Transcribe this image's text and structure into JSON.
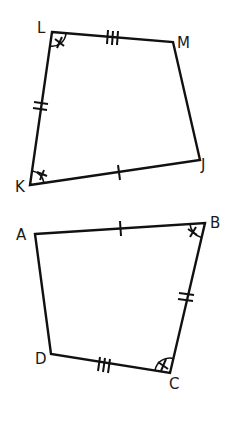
{
  "diagram": {
    "title": "",
    "figures": [
      {
        "name": "LMJK",
        "vertices": {
          "L": {
            "label": "L",
            "x": 52,
            "y": 32
          },
          "M": {
            "label": "M",
            "x": 173,
            "y": 42
          },
          "J": {
            "label": "J",
            "x": 200,
            "y": 160
          },
          "K": {
            "label": "K",
            "x": 30,
            "y": 185
          }
        },
        "sides": [
          {
            "from": "L",
            "to": "M",
            "ticks": 3
          },
          {
            "from": "M",
            "to": "J",
            "ticks": 0
          },
          {
            "from": "J",
            "to": "K",
            "ticks": 1
          },
          {
            "from": "K",
            "to": "L",
            "ticks": 2
          }
        ],
        "angle_marks": [
          "L",
          "K"
        ]
      },
      {
        "name": "ABCD",
        "vertices": {
          "A": {
            "label": "A",
            "x": 35,
            "y": 234
          },
          "B": {
            "label": "B",
            "x": 205,
            "y": 223
          },
          "C": {
            "label": "C",
            "x": 170,
            "y": 373
          },
          "D": {
            "label": "D",
            "x": 51,
            "y": 354
          }
        },
        "sides": [
          {
            "from": "A",
            "to": "B",
            "ticks": 1
          },
          {
            "from": "B",
            "to": "C",
            "ticks": 2
          },
          {
            "from": "C",
            "to": "D",
            "ticks": 3
          },
          {
            "from": "D",
            "to": "A",
            "ticks": 0
          }
        ],
        "angle_marks": [
          "B",
          "C"
        ]
      }
    ],
    "labels": {
      "L": "L",
      "M": "M",
      "J": "J",
      "K": "K",
      "A": "A",
      "B": "B",
      "C": "C",
      "D": "D"
    },
    "colors": {
      "stroke": "#111111",
      "background": "#ffffff"
    }
  }
}
